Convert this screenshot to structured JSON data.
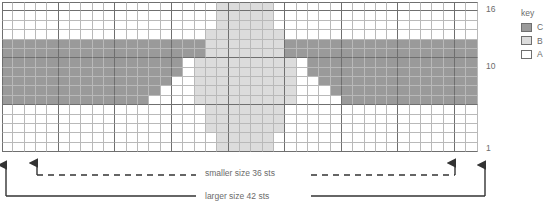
{
  "chart_data": {
    "type": "heatmap",
    "title": "",
    "xlabel": "",
    "ylabel": "",
    "columns": 42,
    "rows": 16,
    "row_labels_visible": [
      "16",
      "10",
      "1"
    ],
    "row_label_rows": [
      16,
      10,
      1
    ],
    "major_gridline_every": 5,
    "legend_position": "right",
    "palette": {
      "A": "#ffffff",
      "B": "#dcdcdc",
      "C": "#9a9a9a"
    },
    "legend_entries": [
      {
        "symbol": "C",
        "color": "#9a9a9a"
      },
      {
        "symbol": "B",
        "color": "#dcdcdc"
      },
      {
        "symbol": "A",
        "color": "#ffffff"
      }
    ],
    "grid": [
      "AAAAAAAAAAAAAAAAAAABBBBBAAAAAAAAAAAAAAAAAAA",
      "AAAAAAAAAAAAAAAAAAABBBBBAAAAAAAAAAAAAAAAAAA",
      "AAAAAAAAAAAAAAAAAAABBBBBAAAAAAAAAAAAAAAAAAA",
      "AAAAAAAAAAAAAAAAAABBBBBBBAAAAAAAAAAAAAAAAAA",
      "CCCCCCCCCCCCCCCCCCBBBBBBBCCCCCCCCCCCCCCCCCC",
      "CCCCCCCCCCCCCCCCCCBBBBBBBCCCCCCCCCCCCCCCCCC",
      "CCCCCCCCCCCCCCCCABBBBBBBBBACCCCCCCCCCCCCCCC",
      "CCCCCCCCCCCCCCCCABBBBBBBBBACCCCCCCCCCCCCCCC",
      "CCCCCCCCCCCCCCCAABBBBBBBBBAACCCCCCCCCCCCCCC",
      "CCCCCCCCCCCCCCAAABBBBBBBBBAAACCCCCCCCCCCCCC",
      "CCCCCCCCCCCCCAAAABBBBBBBBBAAAACCCCCCCCCCCCC",
      "AAAAAAAAAAAAAAAAAABBBBBBBAAAAAAAAAAAAAAAAAA",
      "AAAAAAAAAAAAAAAAAABBBBBBBAAAAAAAAAAAAAAAAAA",
      "AAAAAAAAAAAAAAAAAABBBBBBBAAAAAAAAAAAAAAAAAA",
      "AAAAAAAAAAAAAAAAAAABBBBBAAAAAAAAAAAAAAAAAAA",
      "AAAAAAAAAAAAAAAAAAABBBBBAAAAAAAAAAAAAAAAAAA"
    ]
  },
  "key": {
    "title": "key",
    "items": [
      {
        "label": "C"
      },
      {
        "label": "B"
      },
      {
        "label": "A"
      }
    ]
  },
  "row_labels": {
    "top": "16",
    "middle": "10",
    "bottom": "1"
  },
  "annotations": {
    "smaller_size": "smaller size 36 sts",
    "larger_size": "larger size 42 sts"
  }
}
